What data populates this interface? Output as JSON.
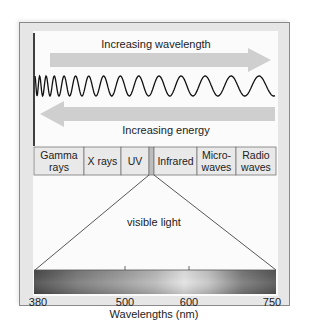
{
  "diagram": {
    "top_arrow": {
      "label": "Increasing wavelength",
      "direction": "right"
    },
    "bottom_arrow": {
      "label": "Increasing energy",
      "direction": "left"
    },
    "wave": {
      "description": "sine wave with increasing wavelength from left to right"
    },
    "spectrum_bands": [
      {
        "label": "Gamma rays"
      },
      {
        "label": "X rays"
      },
      {
        "label": "UV"
      },
      {
        "label": ""
      },
      {
        "label": "Infrared"
      },
      {
        "label": "Micro-waves"
      },
      {
        "label": "Radio waves"
      }
    ],
    "band_lines": [
      {
        "l1": "Gamma",
        "l2": "rays"
      },
      {
        "l1": "X rays",
        "l2": ""
      },
      {
        "l1": "UV",
        "l2": ""
      },
      {
        "l1": "",
        "l2": ""
      },
      {
        "l1": "Infrared",
        "l2": ""
      },
      {
        "l1": "Micro-",
        "l2": "waves"
      },
      {
        "l1": "Radio",
        "l2": "waves"
      }
    ],
    "visible_light_label": "visible light",
    "axis": {
      "ticks": [
        "380",
        "500",
        "600",
        "750"
      ],
      "title": "Wavelengths (nm)"
    },
    "colors": {
      "frame_bg": "#e6e6e6",
      "panel_bg": "#ffffff",
      "arrow_fill": "#cfcfcf",
      "band_fill": "#e9e9e9",
      "visible_band_fill": "#bdbdbd",
      "line": "#333333"
    }
  }
}
